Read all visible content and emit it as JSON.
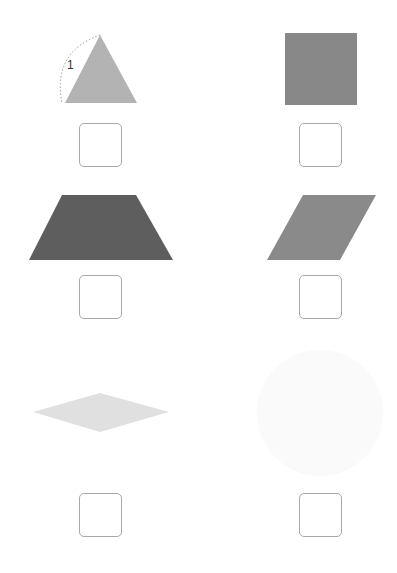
{
  "worksheet": {
    "items": [
      {
        "id": "triangle",
        "shape": "equilateral-triangle",
        "fill": "#b3b3b3",
        "side_label": "1",
        "answer": ""
      },
      {
        "id": "square",
        "shape": "square",
        "fill": "#888888",
        "answer": ""
      },
      {
        "id": "trapezoid",
        "shape": "trapezoid",
        "fill": "#5e5e5e",
        "answer": ""
      },
      {
        "id": "parallelogram",
        "shape": "parallelogram",
        "fill": "#8a8a8a",
        "answer": ""
      },
      {
        "id": "rhombus",
        "shape": "rhombus",
        "fill": "#e0e0e0",
        "answer": ""
      },
      {
        "id": "circle",
        "shape": "circle",
        "fill": "#fafafa",
        "answer": ""
      }
    ],
    "colors": {
      "box_border": "#a9a9a9",
      "dotted_arc": "#9a9a9a",
      "label_text": "#333333"
    }
  }
}
